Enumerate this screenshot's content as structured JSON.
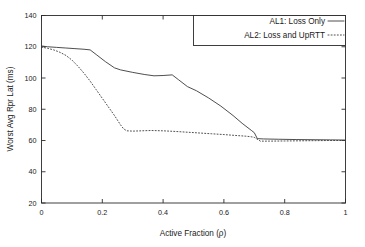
{
  "chart_data": {
    "type": "line",
    "title": "",
    "xlabel": "Active Fraction  (ρ)",
    "ylabel": "Worst Avg Rpr Lat (ms)",
    "xlim": [
      0,
      1
    ],
    "ylim": [
      20,
      140
    ],
    "xticks": [
      0,
      0.2,
      0.4,
      0.6,
      0.8,
      1
    ],
    "xticklabels": [
      "0",
      "0.2",
      "0.4",
      "0.6",
      "0.8",
      "1"
    ],
    "yticks": [
      20,
      40,
      60,
      80,
      100,
      120,
      140
    ],
    "yticklabels": [
      "20",
      "40",
      "60",
      "80",
      "100",
      "120",
      "140"
    ],
    "grid": false,
    "legend_position": "top-right",
    "series": [
      {
        "name": "AL1: Loss Only",
        "style": "solid",
        "color": "#3a3a3a",
        "x": [
          0.0,
          0.02,
          0.05,
          0.08,
          0.11,
          0.14,
          0.16,
          0.18,
          0.21,
          0.24,
          0.26,
          0.3,
          0.34,
          0.37,
          0.4,
          0.43,
          0.45,
          0.48,
          0.51,
          0.55,
          0.59,
          0.63,
          0.66,
          0.69,
          0.7,
          0.71,
          0.73,
          0.78,
          0.84,
          0.9,
          0.95,
          1.0
        ],
        "y": [
          120.5,
          120.0,
          119.6,
          119.2,
          118.8,
          118.4,
          118.0,
          115.0,
          110.5,
          106.5,
          105.2,
          103.6,
          102.2,
          101.4,
          101.6,
          102.0,
          99.0,
          94.5,
          91.8,
          87.2,
          82.0,
          76.0,
          71.0,
          66.5,
          65.0,
          61.2,
          61.0,
          60.8,
          60.6,
          60.5,
          60.4,
          60.3
        ]
      },
      {
        "name": "AL2: Loss and UpRTT",
        "style": "dotted",
        "color": "#3a3a3a",
        "x": [
          0.0,
          0.02,
          0.04,
          0.06,
          0.08,
          0.1,
          0.12,
          0.14,
          0.16,
          0.18,
          0.2,
          0.22,
          0.24,
          0.26,
          0.27,
          0.28,
          0.3,
          0.33,
          0.36,
          0.4,
          0.44,
          0.48,
          0.52,
          0.56,
          0.6,
          0.64,
          0.67,
          0.69,
          0.7,
          0.72,
          0.75,
          0.8,
          0.85,
          0.9,
          0.95,
          1.0
        ],
        "y": [
          119.8,
          119.0,
          118.0,
          116.5,
          114.5,
          111.5,
          107.5,
          103.0,
          98.0,
          92.5,
          87.0,
          81.5,
          76.0,
          70.0,
          67.5,
          66.2,
          66.0,
          66.2,
          66.4,
          66.2,
          65.8,
          65.3,
          64.8,
          64.3,
          63.8,
          63.2,
          62.8,
          62.4,
          62.0,
          59.6,
          59.6,
          59.7,
          59.8,
          59.9,
          60.0,
          60.0
        ]
      }
    ]
  },
  "legend": {
    "entries": [
      {
        "label": "AL1: Loss Only",
        "style": "solid"
      },
      {
        "label": "AL2: Loss and UpRTT",
        "style": "dotted"
      }
    ]
  },
  "axes": {
    "x_title": "Active Fraction  (ρ)",
    "y_title": "Worst Avg Rpr Lat (ms)"
  }
}
